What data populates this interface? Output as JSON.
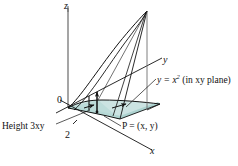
{
  "figure": {
    "type": "3d-calculus-diagram",
    "background_color": "#ffffff",
    "line_color": "#1a1a1a",
    "axis_color": "#8a8a8a",
    "shade_fill": "#c9e2e0",
    "shade_fill_dark": "#a9cfcd",
    "shade_stroke": "#4f7d7b"
  },
  "axes": {
    "z_label": "z",
    "y_label": "y",
    "x_label": "x",
    "origin_label": "0"
  },
  "ticks": {
    "x_tick_label": "2"
  },
  "annotations": {
    "curve_label": "y = x",
    "curve_label_exponent": "2",
    "curve_label_suffix": " (in xy plane)",
    "height_label": "Height 3xy",
    "point_label": "P = (x, y)"
  }
}
